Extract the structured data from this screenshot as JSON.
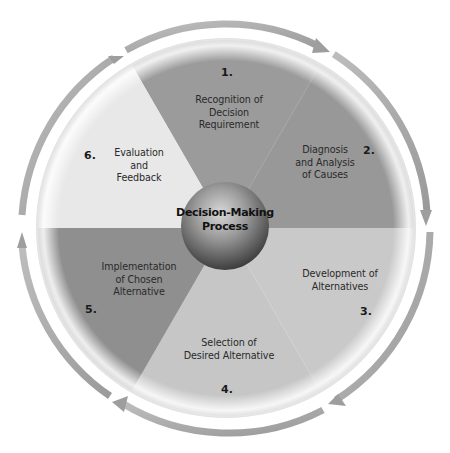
{
  "diagram": {
    "title": "Decision-Making Process",
    "center": {
      "line1": "Decision-Making",
      "line2": "Process"
    },
    "colors": {
      "segment_1": "#9b9b9b",
      "segment_2": "#989898",
      "segment_3": "#c9c9c9",
      "segment_4": "#c6c6c6",
      "segment_5": "#8f8f8f",
      "segment_6": "#e8e8e8",
      "arrow": "#a8a8a8",
      "sphere_dark": "#4a4a4a",
      "sphere_light": "#cfcfcf"
    },
    "steps": [
      {
        "number": "1.",
        "line1": "Recognition of",
        "line2": "Decision",
        "line3": "Requirement"
      },
      {
        "number": "2.",
        "line1": "Diagnosis",
        "line2": "and Analysis",
        "line3": "of Causes"
      },
      {
        "number": "3.",
        "line1": "Development of",
        "line2": "Alternatives"
      },
      {
        "number": "4.",
        "line1": "Selection of",
        "line2": "Desired Alternative"
      },
      {
        "number": "5.",
        "line1": "Implementation",
        "line2": "of Chosen",
        "line3": "Alternative"
      },
      {
        "number": "6.",
        "line1": "Evaluation",
        "line2": "and",
        "line3": "Feedback"
      }
    ]
  }
}
